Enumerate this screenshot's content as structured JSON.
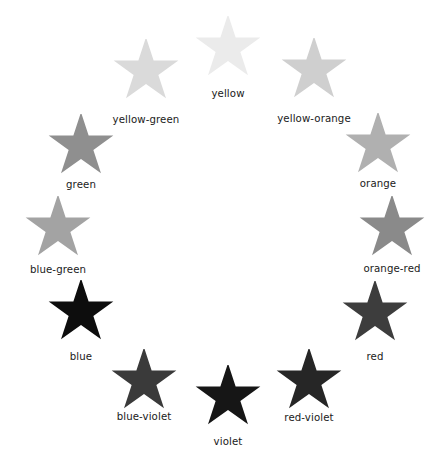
{
  "diagram": {
    "background_color": "#ffffff",
    "label_color": "#1a1a1a",
    "star_icon_name": "five-pointed-star-icon",
    "center": {
      "x": 224,
      "y": 228
    },
    "radius": 171,
    "star_width": 68,
    "star_height": 64,
    "items": [
      {
        "label": "yellow",
        "color": "#ebebeb",
        "angle_deg": -90,
        "star_x": 228,
        "star_y": 48,
        "label_x": 228,
        "label_y": 91
      },
      {
        "label": "yellow-orange",
        "color": "#cfcfcf",
        "angle_deg": -60,
        "star_x": 314,
        "star_y": 70,
        "label_x": 314,
        "label_y": 116
      },
      {
        "label": "orange",
        "color": "#b0b0b0",
        "angle_deg": -30,
        "star_x": 378,
        "star_y": 145,
        "label_x": 378,
        "label_y": 181
      },
      {
        "label": "orange-red",
        "color": "#8a8a8a",
        "angle_deg": 0,
        "star_x": 392,
        "star_y": 228,
        "label_x": 392,
        "label_y": 266
      },
      {
        "label": "red",
        "color": "#3d3d3d",
        "angle_deg": 30,
        "star_x": 375,
        "star_y": 313,
        "label_x": 375,
        "label_y": 354
      },
      {
        "label": "red-violet",
        "color": "#262626",
        "angle_deg": 60,
        "star_x": 309,
        "star_y": 381,
        "label_x": 309,
        "label_y": 415
      },
      {
        "label": "violet",
        "color": "#161616",
        "angle_deg": 90,
        "star_x": 228,
        "star_y": 397,
        "label_x": 228,
        "label_y": 439
      },
      {
        "label": "blue-violet",
        "color": "#3a3a3a",
        "angle_deg": 120,
        "star_x": 144,
        "star_y": 381,
        "label_x": 144,
        "label_y": 414
      },
      {
        "label": "blue",
        "color": "#0d0d0d",
        "angle_deg": 150,
        "star_x": 81,
        "star_y": 312,
        "label_x": 81,
        "label_y": 354
      },
      {
        "label": "blue-green",
        "color": "#a3a3a3",
        "angle_deg": 180,
        "star_x": 58,
        "star_y": 228,
        "label_x": 58,
        "label_y": 267
      },
      {
        "label": "green",
        "color": "#8f8f8f",
        "angle_deg": -150,
        "star_x": 81,
        "star_y": 146,
        "label_x": 81,
        "label_y": 182
      },
      {
        "label": "yellow-green",
        "color": "#dadada",
        "angle_deg": -120,
        "star_x": 146,
        "star_y": 71,
        "label_x": 146,
        "label_y": 117
      }
    ]
  }
}
